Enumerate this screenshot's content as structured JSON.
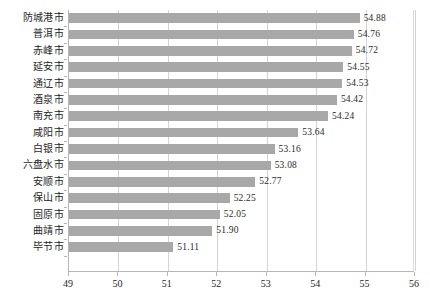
{
  "chart_data": {
    "type": "bar",
    "orientation": "horizontal",
    "title": "",
    "subtitle": "",
    "xlabel": "",
    "ylabel": "",
    "xlim": [
      49,
      56
    ],
    "xticks": [
      49,
      50,
      51,
      52,
      53,
      54,
      55,
      56
    ],
    "xtick_labels": [
      "49",
      "50",
      "51",
      "52",
      "53",
      "54",
      "55",
      "56"
    ],
    "grid": true,
    "legend": false,
    "legend_position": "none",
    "series_color": "#a8a8a8",
    "categories": [
      "防城港市",
      "普洱市",
      "赤峰市",
      "延安市",
      "通辽市",
      "酒泉市",
      "南充市",
      "咸阳市",
      "白银市",
      "六盘水市",
      "安顺市",
      "保山市",
      "固原市",
      "曲靖市",
      "毕节市"
    ],
    "values": [
      54.88,
      54.76,
      54.72,
      54.55,
      54.53,
      54.42,
      54.24,
      53.64,
      53.16,
      53.08,
      52.77,
      52.25,
      52.05,
      51.9,
      51.11
    ],
    "value_labels": [
      "54.88",
      "54.76",
      "54.72",
      "54.55",
      "54.53",
      "54.42",
      "54.24",
      "53.64",
      "53.16",
      "53.08",
      "52.77",
      "52.25",
      "52.05",
      "51.90",
      "51.11"
    ]
  }
}
